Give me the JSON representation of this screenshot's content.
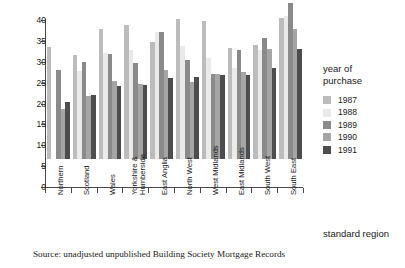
{
  "chart_data": {
    "type": "bar",
    "title": "",
    "xlabel": "standard region",
    "ylabel": "",
    "ylim": [
      0,
      40
    ],
    "yticks": [
      0,
      5,
      10,
      15,
      20,
      25,
      30,
      35,
      40
    ],
    "grid": false,
    "legend_position": "right",
    "legend_title": "year of\npurchase",
    "categories": [
      "Northern",
      "Scotland",
      "Wales",
      "Yorkshire &\nHumberside",
      "East Anglia",
      "North West",
      "West Midlands",
      "East Midlands",
      "South West",
      "South East"
    ],
    "series": [
      {
        "name": "1987",
        "color": "#bcbcbc",
        "values": [
          26.8,
          24.8,
          31.1,
          32.0,
          28.1,
          33.6,
          33.0,
          26.7,
          27.3,
          33.8
        ]
      },
      {
        "name": "1988",
        "color": "#eaeaea",
        "values": [
          0.0,
          21.2,
          25.4,
          26.1,
          30.5,
          27.0,
          24.3,
          21.8,
          26.0,
          34.3
        ]
      },
      {
        "name": "1989",
        "color": "#8a8a8a",
        "values": [
          21.3,
          23.2,
          25.2,
          23.1,
          30.5,
          23.8,
          20.3,
          26.1,
          29.0,
          37.3
        ]
      },
      {
        "name": "1990",
        "color": "#a5a5a5",
        "values": [
          12.0,
          15.2,
          18.6,
          18.0,
          21.4,
          18.5,
          20.3,
          20.8,
          26.4,
          31.2
        ]
      },
      {
        "name": "1991",
        "color": "#4d4d4d",
        "values": [
          13.6,
          15.4,
          17.6,
          17.8,
          19.5,
          19.7,
          20.2,
          20.2,
          21.9,
          26.4
        ]
      }
    ]
  },
  "source_note": "Source: unadjusted unpublished Building Society Mortgage Records",
  "colors": {
    "axis": "#4a4a4a",
    "text": "#1a1a1a",
    "background": "#ffffff"
  }
}
